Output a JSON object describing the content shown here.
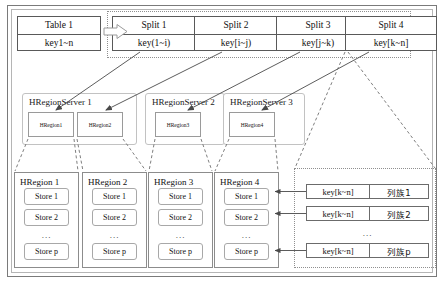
{
  "diagram": {
    "source_table": {
      "name": "Table 1",
      "keyrange": "key1~n"
    },
    "split_arrow": {
      "icon": "block-arrow-right-icon"
    },
    "splits": [
      {
        "name": "Split 1",
        "keyrange": "key(1~i)"
      },
      {
        "name": "Split 2",
        "keyrange": "key[i~j)"
      },
      {
        "name": "Split 3",
        "keyrange": "key[j~k)"
      },
      {
        "name": "Split 4",
        "keyrange": "key[k~n]"
      }
    ],
    "region_servers": [
      {
        "name": "HRegionServer 1",
        "regions": [
          "HRegion1",
          "HRegion2"
        ]
      },
      {
        "name": "HRegionServer 2",
        "regions": [
          "HRegion3"
        ]
      },
      {
        "name": "HRegionServer 3",
        "regions": [
          "HRegion4"
        ]
      }
    ],
    "hregions": [
      {
        "name": "HRegion 1",
        "stores": [
          "Store 1",
          "Store 2",
          "Store p"
        ],
        "ellipsis": "..."
      },
      {
        "name": "HRegion 2",
        "stores": [
          "Store 1",
          "Store 2",
          "Store p"
        ],
        "ellipsis": "..."
      },
      {
        "name": "HRegion 3",
        "stores": [
          "Store 1",
          "Store 2",
          "Store p"
        ],
        "ellipsis": "..."
      },
      {
        "name": "HRegion 4",
        "stores": [
          "Store 1",
          "Store 2",
          "Store p"
        ],
        "ellipsis": "..."
      }
    ],
    "column_family_rows": [
      {
        "key": "key[k~n]",
        "family": "列族1"
      },
      {
        "key": "key[k~n]",
        "family": "列族2"
      },
      {
        "key": "key[k~n]",
        "family": "列族p"
      }
    ],
    "column_family_ellipsis": "...",
    "colors": {
      "line": "#595959",
      "soft_line": "#b9b9b9",
      "dotted_line": "#8f8f8f",
      "background": "#ffffff",
      "text": "#111111"
    }
  }
}
